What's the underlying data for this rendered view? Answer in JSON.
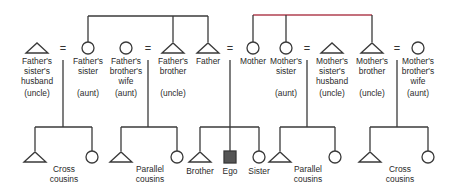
{
  "colors": {
    "line": "#3a3a3a",
    "accent_line": "#b04050",
    "ego_fill": "#555555"
  },
  "adults": [
    {
      "id": "fss_husband",
      "symbol": "triangle",
      "x": 37,
      "label": "Father's\nsister's\nhusband",
      "term": "(uncle)"
    },
    {
      "id": "f_sister",
      "symbol": "circle",
      "x": 88,
      "label": "Father's\nsister",
      "term": "(aunt)"
    },
    {
      "id": "fb_wife",
      "symbol": "circle",
      "x": 126,
      "label": "Father's\nbrother's\nwife",
      "term": "(aunt)"
    },
    {
      "id": "f_brother",
      "symbol": "triangle",
      "x": 173,
      "label": "Father's\nbrother",
      "term": "(uncle)"
    },
    {
      "id": "father",
      "symbol": "triangle",
      "x": 208,
      "label": "Father",
      "term": ""
    },
    {
      "id": "mother",
      "symbol": "circle",
      "x": 253,
      "label": "Mother",
      "term": ""
    },
    {
      "id": "m_sister",
      "symbol": "circle",
      "x": 286,
      "label": "Mother's\nsister",
      "term": "(aunt)"
    },
    {
      "id": "ms_husband",
      "symbol": "triangle",
      "x": 332,
      "label": "Mother's\nsister's\nhusband",
      "term": "(uncle)"
    },
    {
      "id": "m_brother",
      "symbol": "triangle",
      "x": 372,
      "label": "Mother's\nbrother",
      "term": "(uncle)"
    },
    {
      "id": "mb_wife",
      "symbol": "circle",
      "x": 418,
      "label": "Mother's\nbrother's\nwife",
      "term": "(aunt)"
    }
  ],
  "marriages": [
    {
      "x": 63,
      "label": "="
    },
    {
      "x": 148,
      "label": "="
    },
    {
      "x": 230,
      "label": "="
    },
    {
      "x": 307,
      "label": "="
    },
    {
      "x": 397,
      "label": "="
    }
  ],
  "sibling_groups": [
    {
      "name": "father-siblings",
      "bar_y": 16,
      "drops": [
        88,
        173,
        208
      ]
    },
    {
      "name": "mother-siblings",
      "bar_y": 15,
      "drops": [
        253,
        286,
        372
      ]
    }
  ],
  "families": [
    {
      "name": "fathers-sister-children",
      "drop_x": 63,
      "left": 35,
      "right": 92,
      "children": [
        {
          "symbol": "triangle",
          "x": 35
        },
        {
          "symbol": "circle",
          "x": 92
        }
      ],
      "label": "Cross\ncousins",
      "label_x": 64
    },
    {
      "name": "fathers-brother-children",
      "drop_x": 148,
      "left": 121,
      "right": 177,
      "children": [
        {
          "symbol": "triangle",
          "x": 121
        },
        {
          "symbol": "circle",
          "x": 177
        }
      ],
      "label": "Parallel\ncousins",
      "label_x": 150
    },
    {
      "name": "ego-siblings",
      "drop_x": 230,
      "left": 200,
      "right": 259,
      "children": [
        {
          "symbol": "triangle",
          "x": 200,
          "label": "Brother"
        },
        {
          "symbol": "square",
          "x": 230,
          "label": "Ego"
        },
        {
          "symbol": "circle",
          "x": 259,
          "label": "Sister"
        }
      ],
      "label": "",
      "label_x": 230
    },
    {
      "name": "mothers-sister-children",
      "drop_x": 307,
      "left": 280,
      "right": 335,
      "children": [
        {
          "symbol": "triangle",
          "x": 280
        },
        {
          "symbol": "circle",
          "x": 335
        }
      ],
      "label": "Parallel\ncousins",
      "label_x": 308
    },
    {
      "name": "mothers-brother-children",
      "drop_x": 397,
      "left": 370,
      "right": 428,
      "children": [
        {
          "symbol": "triangle",
          "x": 370
        },
        {
          "symbol": "circle",
          "x": 428
        }
      ],
      "label": "Cross\ncousins",
      "label_x": 400
    }
  ]
}
